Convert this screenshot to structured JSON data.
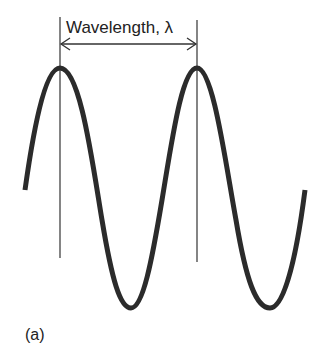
{
  "figure": {
    "title_label": "Wavelength, λ",
    "panel_label": "(a)",
    "colors": {
      "wave": "#2b2b2b",
      "guide_lines": "#333333",
      "text": "#222222",
      "background": "#ffffff"
    },
    "wave": {
      "type": "sine",
      "peaks_x": [
        60,
        197
      ],
      "troughs_x": [
        131,
        270
      ],
      "peak_y": 68,
      "trough_y": 308,
      "start": [
        25,
        190
      ],
      "end": [
        305,
        190
      ]
    },
    "dimension_arrow": {
      "from_x": 60,
      "to_x": 197,
      "y": 44,
      "meaning": "one wavelength (peak to peak)"
    }
  }
}
